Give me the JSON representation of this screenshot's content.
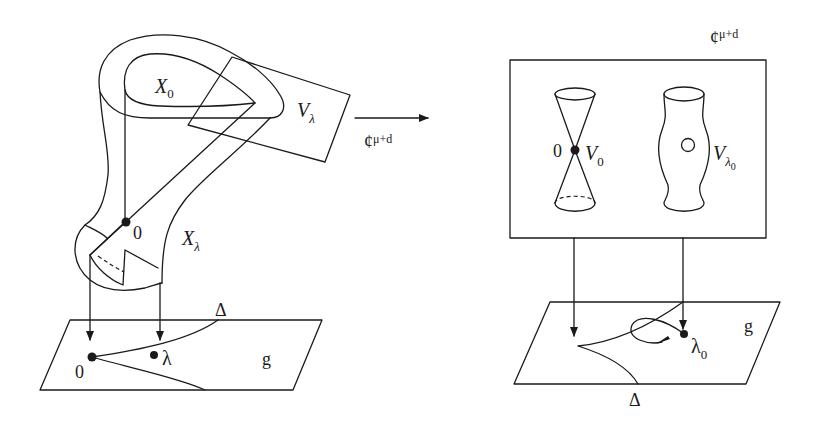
{
  "diagram": {
    "left": {
      "labels": {
        "X0": {
          "base": "X",
          "sub": "0"
        },
        "Vlambda": {
          "base": "V",
          "sub": "λ"
        },
        "Xlambda": {
          "base": "X",
          "sub": "λ"
        },
        "origin_fiber": "0",
        "delta": "Δ",
        "origin_base": "0",
        "lambda": "λ",
        "g": "g"
      }
    },
    "arrow": {
      "label_base": "¢",
      "label_sup": "μ+d"
    },
    "right": {
      "space_label_base": "¢",
      "space_label_sup": "μ+d",
      "labels": {
        "origin": "0",
        "V0": {
          "base": "V",
          "sub": "0"
        },
        "Vlambda0": {
          "base": "V",
          "sub": "λ",
          "subsub": "0"
        },
        "lambda0": {
          "base": "λ",
          "sub": "0"
        },
        "delta": "Δ",
        "g": "g"
      }
    },
    "colors": {
      "stroke": "#1a1a1a",
      "background": "#ffffff"
    }
  }
}
